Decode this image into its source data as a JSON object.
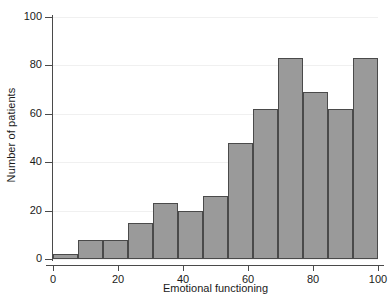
{
  "chart_data": {
    "type": "bar",
    "title": "",
    "subtitle": "",
    "xlabel": "Emotional functioning",
    "ylabel": "Number of patients",
    "categories": [
      "0-7.7",
      "7.7-15.4",
      "15.4-23.1",
      "23.1-30.8",
      "30.8-38.5",
      "38.5-46.2",
      "46.2-53.8",
      "53.8-61.5",
      "61.5-69.2",
      "69.2-76.9",
      "76.9-84.6",
      "84.6-92.3",
      "92.3-100"
    ],
    "bin_edges": [
      0,
      7.7,
      15.4,
      23.1,
      30.8,
      38.5,
      46.2,
      53.8,
      61.5,
      69.2,
      76.9,
      84.6,
      92.3,
      100
    ],
    "values": [
      2,
      8,
      8,
      15,
      23,
      20,
      26,
      48,
      62,
      83,
      69,
      62,
      83
    ],
    "xlim": [
      0,
      100
    ],
    "ylim": [
      0,
      100
    ],
    "xticks": [
      0,
      20,
      40,
      60,
      80,
      100
    ],
    "yticks": [
      0,
      20,
      40,
      60,
      80,
      100
    ],
    "grid": true,
    "legend": false,
    "bar_color": "#9a9a9a",
    "bar_edge_color": "#4a4a4a",
    "axis_color": "#4a4a4a",
    "grid_color": "#f0f0f0",
    "background": "#ffffff"
  }
}
